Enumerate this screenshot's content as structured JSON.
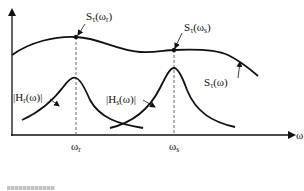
{
  "diagram": {
    "type": "spectral-resonance-illustration",
    "axes": {
      "x_label": "ω",
      "x_ticks": [
        {
          "label": "ω",
          "sub": "r"
        },
        {
          "label": "ω",
          "sub": "s"
        }
      ]
    },
    "curves": {
      "spectrum": {
        "label": "S",
        "label_sub": "τ",
        "label_arg": "(ω)"
      },
      "h_r": {
        "label": "|H",
        "label_sub": "r",
        "label_arg": "(ω)|"
      },
      "h_s": {
        "label": "|H",
        "label_sub": "s",
        "label_arg": "(ω)|"
      }
    },
    "points": {
      "s_at_wr": {
        "label": "S",
        "label_sub": "τ",
        "arg": "(ω",
        "arg_sub": "r",
        "close": ")"
      },
      "s_at_ws": {
        "label": "S",
        "label_sub": "τ",
        "arg": "(ω",
        "arg_sub": "s",
        "close": ")"
      }
    },
    "colors": {
      "stroke": "#111111",
      "dashed": "#555555",
      "background": "#ffffff"
    }
  }
}
